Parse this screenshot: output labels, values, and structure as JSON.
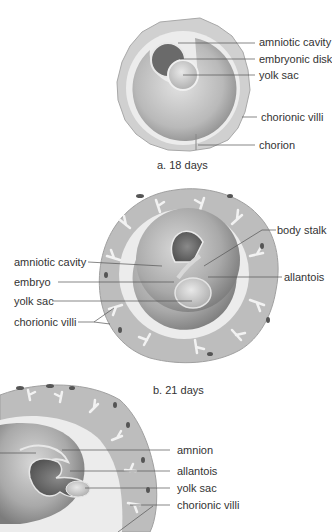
{
  "figure_a": {
    "caption": "a.  18 days",
    "labels": {
      "amniotic_cavity": "amniotic cavity",
      "embryonic_disk": "embryonic disk",
      "yolk_sac": "yolk sac",
      "chorionic_villi": "chorionic villi",
      "chorion": "chorion"
    }
  },
  "figure_b": {
    "caption": "b.  21 days",
    "labels": {
      "body_stalk": "body stalk",
      "amniotic_cavity": "amniotic cavity",
      "embryo": "embryo",
      "allantois": "allantois",
      "yolk_sac": "yolk sac",
      "chorionic_villi": "chorionic villi"
    }
  },
  "figure_c": {
    "labels": {
      "amnion": "amnion",
      "allantois": "allantois",
      "yolk_sac": "yolk sac",
      "chorionic_villi": "chorionic villi"
    }
  },
  "colors": {
    "background": "#ffffff",
    "outer_chorion": "#c4c4c4",
    "chorion_light": "#e6e6e6",
    "cavity": "#9a9a9a",
    "dark": "#5a5a5a",
    "leader_line": "#555555",
    "text": "#333333"
  }
}
